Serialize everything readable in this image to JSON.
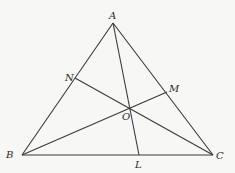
{
  "diagram": {
    "type": "triangle-cevians",
    "points": {
      "A": {
        "label": "A",
        "x": 113,
        "y": 23
      },
      "B": {
        "label": "B",
        "x": 22,
        "y": 155
      },
      "C": {
        "label": "C",
        "x": 213,
        "y": 155
      },
      "L": {
        "label": "L",
        "x": 139,
        "y": 155
      },
      "M": {
        "label": "M",
        "x": 167,
        "y": 92
      },
      "N": {
        "label": "N",
        "x": 75,
        "y": 78
      },
      "O": {
        "label": "O",
        "x": 130,
        "y": 107
      }
    },
    "segments": [
      {
        "name": "AB",
        "from": "A",
        "to": "B"
      },
      {
        "name": "BC",
        "from": "B",
        "to": "C"
      },
      {
        "name": "CA",
        "from": "C",
        "to": "A"
      },
      {
        "name": "AL",
        "from": "A",
        "to": "L"
      },
      {
        "name": "BM",
        "from": "B",
        "to": "M"
      },
      {
        "name": "CN",
        "from": "C",
        "to": "N"
      }
    ],
    "labels": {
      "A": "A",
      "B": "B",
      "C": "C",
      "L": "L",
      "M": "M",
      "N": "N",
      "O": "O"
    }
  }
}
